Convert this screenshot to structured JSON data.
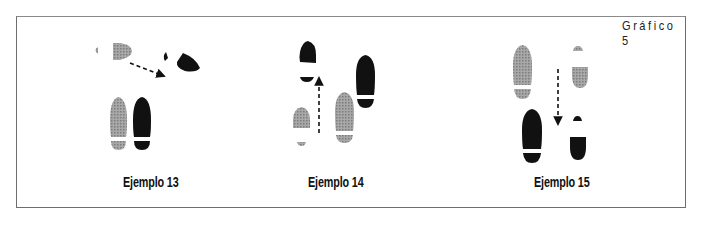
{
  "figure": {
    "title": "Gráfico 5",
    "examples": [
      {
        "label": "Ejemplo 13",
        "description": "Diagonal step: gray footprint top-left, black footprint top-right, dashed arrow pointing right-down; pair of full footprints (gray left, black right) below"
      },
      {
        "label": "Ejemplo 14",
        "description": "Forward step: gray partial footprint bottom-left, dashed arrow pointing up to black partial footprint; full gray and black footprints to the right, staggered"
      },
      {
        "label": "Ejemplo 15",
        "description": "Backward step: full gray footprint top-left, black full footprint below; dashed arrow pointing down; gray partial footprint top-right and black partial footprint bottom-right"
      }
    ]
  },
  "colors": {
    "gray_foot": "#9a9a9a",
    "black_foot": "#111111",
    "frame": "#6e6e6e"
  }
}
